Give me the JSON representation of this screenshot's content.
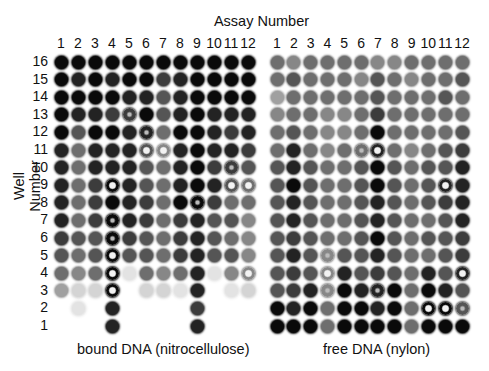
{
  "figure": {
    "title": "Assay Number",
    "ylabel": "Well Number",
    "column_labels": [
      "1",
      "2",
      "3",
      "4",
      "5",
      "6",
      "7",
      "8",
      "9",
      "10",
      "11",
      "12"
    ],
    "row_labels": [
      "16",
      "15",
      "14",
      "13",
      "12",
      "11",
      "10",
      "9",
      "8",
      "7",
      "6",
      "5",
      "4",
      "3",
      "2",
      "1"
    ],
    "ink_color": "#111111",
    "panels": [
      {
        "caption": "bound DNA (nitrocellulose)",
        "note": "intensity 0-9 (0 = no spot, 9 = black); 'r' = faint ring centre, 'R' = pronounced ring (hollow centre)",
        "rows": [
          [
            "9",
            "9",
            "9",
            "9",
            "9",
            "9",
            "9",
            "9",
            "9",
            "9",
            "9",
            "9"
          ],
          [
            "9",
            "8",
            "9",
            "8",
            "9",
            "9",
            "7",
            "8",
            "9",
            "9",
            "9",
            "9"
          ],
          [
            "9",
            "9",
            "9",
            "9",
            "8",
            "8",
            "6",
            "8",
            "9",
            "9",
            "9",
            "9"
          ],
          [
            "9",
            "8",
            "8",
            "7",
            "7r",
            "9",
            "6",
            "8",
            "9",
            "8",
            "8",
            "8"
          ],
          [
            "9",
            "6",
            "9",
            "9",
            "8",
            "8r",
            "5",
            "9",
            "9",
            "8",
            "7",
            "8"
          ],
          [
            "8",
            "5",
            "8",
            "8",
            "8",
            "6R",
            "4R",
            "8",
            "9",
            "8",
            "8",
            "7"
          ],
          [
            "8",
            "5",
            "8",
            "8",
            "8",
            "6",
            "5",
            "8",
            "9",
            "7",
            "7r",
            "6"
          ],
          [
            "8",
            "5",
            "7",
            "9R",
            "8",
            "6",
            "5",
            "8",
            "9",
            "8",
            "6R",
            "5R"
          ],
          [
            "8",
            "5",
            "7",
            "9",
            "8",
            "7",
            "5",
            "9",
            "9r",
            "7",
            "5",
            "5"
          ],
          [
            "8",
            "5",
            "7",
            "9r",
            "8",
            "7",
            "5",
            "7",
            "8",
            "6",
            "6",
            "4"
          ],
          [
            "7",
            "6",
            "6",
            "9r",
            "7",
            "6",
            "5",
            "7",
            "8",
            "6",
            "5",
            "4"
          ],
          [
            "6",
            "5",
            "6",
            "9R",
            "6",
            "6",
            "5",
            "7",
            "8",
            "6",
            "6",
            "4"
          ],
          [
            "5",
            "4",
            "5",
            "9R",
            "1",
            "5",
            "4",
            "5",
            "8",
            "1",
            "4",
            "4R"
          ],
          [
            "3",
            "2",
            "2",
            "9R",
            "0",
            "2",
            "2",
            "1",
            "8",
            "0",
            "1",
            "2"
          ],
          [
            "0",
            "1",
            "0",
            "8",
            "0",
            "0",
            "0",
            "0",
            "7",
            "0",
            "0",
            "0"
          ],
          [
            "0",
            "0",
            "0",
            "8",
            "0",
            "0",
            "0",
            "0",
            "8",
            "0",
            "0",
            "0"
          ]
        ]
      },
      {
        "caption": "free DNA (nylon)",
        "rows": [
          [
            "5",
            "4",
            "5",
            "5",
            "5",
            "5",
            "4",
            "4",
            "5",
            "5",
            "5",
            "5"
          ],
          [
            "5",
            "6",
            "5",
            "5",
            "5",
            "4",
            "6",
            "5",
            "4",
            "5",
            "5",
            "6"
          ],
          [
            "3",
            "5",
            "5",
            "5",
            "5",
            "5",
            "6",
            "5",
            "5",
            "5",
            "6",
            "5"
          ],
          [
            "4",
            "5",
            "5",
            "4",
            "4",
            "5",
            "7",
            "5",
            "5",
            "5",
            "5",
            "5"
          ],
          [
            "5",
            "6",
            "5",
            "4",
            "4",
            "5",
            "9",
            "5",
            "5",
            "5",
            "5",
            "6"
          ],
          [
            "5",
            "8",
            "5",
            "4",
            "5",
            "5r",
            "8R",
            "5",
            "4",
            "5",
            "6",
            "7"
          ],
          [
            "6",
            "8",
            "6",
            "5",
            "5",
            "6",
            "9",
            "6",
            "5",
            "6",
            "6",
            "8"
          ],
          [
            "6",
            "9",
            "6",
            "5",
            "5",
            "6",
            "9",
            "6",
            "5",
            "6",
            "8R",
            "8"
          ],
          [
            "6",
            "8",
            "6",
            "5",
            "5",
            "6",
            "8",
            "6",
            "5",
            "6",
            "7",
            "8"
          ],
          [
            "6",
            "8",
            "6",
            "5",
            "5",
            "6",
            "8",
            "6",
            "5",
            "5",
            "6",
            "8"
          ],
          [
            "6",
            "7",
            "6",
            "5",
            "5",
            "6",
            "9",
            "6",
            "5",
            "6",
            "6",
            "7"
          ],
          [
            "6",
            "8",
            "6",
            "4r",
            "6",
            "6",
            "8",
            "6",
            "5",
            "5",
            "6",
            "7"
          ],
          [
            "6",
            "7",
            "6",
            "4R",
            "8",
            "6",
            "7",
            "6",
            "5",
            "8",
            "6",
            "8R"
          ],
          [
            "6",
            "7",
            "8",
            "4r",
            "9",
            "8",
            "8r",
            "9",
            "5",
            "9",
            "8",
            "6"
          ],
          [
            "9",
            "8",
            "9",
            "5",
            "9",
            "9",
            "8",
            "9",
            "5",
            "9R",
            "9R",
            "6r"
          ],
          [
            "9",
            "9",
            "9",
            "5",
            "9",
            "9",
            "9",
            "9",
            "5",
            "9",
            "9",
            "9"
          ]
        ]
      }
    ]
  },
  "layout_hints": {
    "left_panel_col1_x": 61,
    "left_panel_col12_x": 248,
    "right_panel_col1_x": 277,
    "right_panel_col12_x": 462,
    "row16_y": 62,
    "row1_y": 326
  }
}
